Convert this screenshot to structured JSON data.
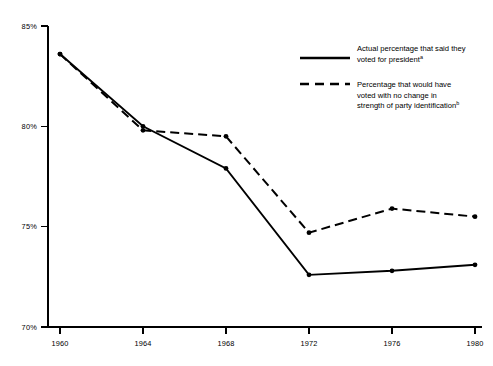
{
  "chart_data": {
    "type": "line",
    "title": "",
    "subtitle": "",
    "xlabel": "",
    "ylabel": "",
    "categories": [
      "1960",
      "1964",
      "1968",
      "1972",
      "1976",
      "1980"
    ],
    "x": [
      1960,
      1964,
      1968,
      1972,
      1976,
      1980
    ],
    "xlim": [
      1960,
      1980
    ],
    "ylim": [
      70,
      85
    ],
    "y_tick_labels": [
      "70%",
      "75%",
      "80%",
      "85%"
    ],
    "y_ticks": [
      70,
      75,
      80,
      85
    ],
    "x_tick_labels": [
      "1960",
      "1964",
      "1968",
      "1972",
      "1976",
      "1980"
    ],
    "grid": false,
    "legend_position": "upper-right",
    "series": [
      {
        "name": "Actual percentage that said they voted for president",
        "name_superscript": "a",
        "style": "solid",
        "color": "#000000",
        "markers": true,
        "values": [
          83.6,
          80.0,
          77.9,
          72.6,
          72.8,
          73.1
        ]
      },
      {
        "name": "Percentage that would have voted with no change in strength of party identification",
        "name_superscript": "b",
        "style": "dashed",
        "color": "#000000",
        "markers": true,
        "values": [
          83.6,
          79.8,
          79.5,
          74.7,
          75.9,
          75.5
        ]
      }
    ]
  },
  "axes": {
    "y_labels": [
      "85%",
      "80%",
      "75%",
      "70%"
    ],
    "x_labels": [
      "1960",
      "1964",
      "1968",
      "1972",
      "1976",
      "1980"
    ]
  },
  "legend": {
    "entries": [
      {
        "style": "solid",
        "lines": [
          "Actual percentage that said they",
          "voted for president"
        ],
        "superscript": "a"
      },
      {
        "style": "dashed",
        "lines": [
          "Percentage that would have",
          "voted with no change in",
          "strength of party identification"
        ],
        "superscript": "b"
      }
    ]
  },
  "colors": {
    "background": "#ffffff",
    "ink": "#000000"
  }
}
